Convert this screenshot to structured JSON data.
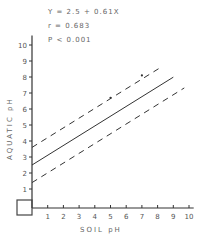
{
  "chart_data": {
    "type": "scatter",
    "title": "",
    "annotations": [
      "Y = 2.5 + 0.61X",
      "r = 0.683",
      "P < 0.001"
    ],
    "xlabel": "SOIL  pH",
    "ylabel": "AQUATIC  pH",
    "xlim": [
      0,
      10
    ],
    "ylim": [
      0,
      10
    ],
    "x_ticks": [
      1,
      2,
      3,
      4,
      5,
      6,
      7,
      8,
      9,
      10
    ],
    "y_ticks": [
      1,
      2,
      3,
      4,
      5,
      6,
      7,
      8,
      9,
      10
    ],
    "grid": false,
    "legend": "none",
    "regression": {
      "intercept": 2.5,
      "slope": 0.61,
      "x_range": [
        0,
        9
      ]
    },
    "confidence_bands": {
      "offset": 1.1,
      "style": "dashed",
      "x_range": [
        0,
        9.7
      ]
    },
    "series": [
      {
        "name": "observations",
        "points": [
          [
            5.0,
            6.7
          ],
          [
            7.0,
            8.1
          ]
        ]
      }
    ]
  },
  "labels": {
    "equation": "Y = 2.5 + 0.61X",
    "r": "r = 0.683",
    "p": "P < 0.001",
    "x_axis": "SOIL    pH",
    "y_axis": "AQUATIC    pH"
  }
}
